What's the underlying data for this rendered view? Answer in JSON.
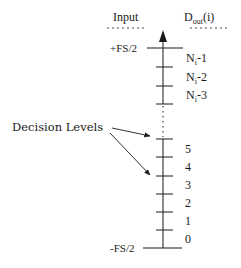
{
  "header": {
    "input_label": "Input",
    "output_label_main": "D",
    "output_label_sub": "out",
    "output_label_suffix": "(i)"
  },
  "axis": {
    "top_label": "+FS/2",
    "bottom_label": "-FS/2"
  },
  "upper_codes": [
    {
      "main": "N",
      "sub": "i",
      "suffix": "-1"
    },
    {
      "main": "N",
      "sub": "i",
      "suffix": "-2"
    },
    {
      "main": "N",
      "sub": "i",
      "suffix": "-3"
    }
  ],
  "lower_codes": [
    "5",
    "4",
    "3",
    "2",
    "1",
    "0"
  ],
  "annotation": {
    "label": "Decision Levels"
  },
  "colors": {
    "ink": "#1a1a1a",
    "background": "#ffffff"
  }
}
